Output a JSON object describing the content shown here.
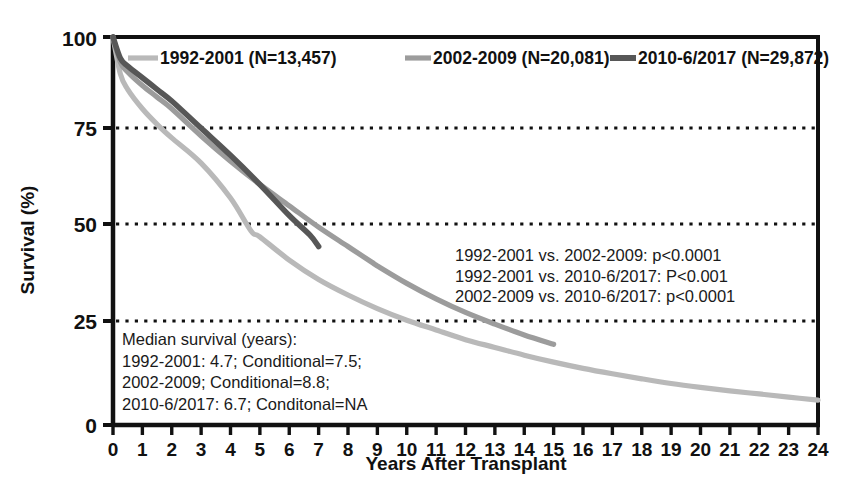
{
  "chart_data": {
    "type": "line",
    "title": "",
    "subtitle": "",
    "xlabel": "Years After Transplant",
    "ylabel": "Survival (%)",
    "xlim": [
      0,
      24
    ],
    "ylim": [
      0,
      100
    ],
    "xticks": [
      "0",
      "1",
      "2",
      "3",
      "4",
      "5",
      "6",
      "7",
      "8",
      "9",
      "10",
      "11",
      "12",
      "13",
      "14",
      "15",
      "16",
      "17",
      "18",
      "19",
      "20",
      "21",
      "22",
      "23",
      "24"
    ],
    "yticks": [
      "0",
      "25",
      "50",
      "75",
      "100"
    ],
    "gridlines_y": [
      25,
      50,
      75
    ],
    "grid": "horizontal-dotted",
    "legend_position": "top-inside",
    "series": [
      {
        "name": "1992-2001 (N=13,457)",
        "color": "#b9b9b9",
        "x": [
          0,
          0.25,
          0.5,
          1,
          1.5,
          2,
          3,
          4,
          4.7,
          5,
          6,
          7,
          8,
          9,
          10,
          11,
          12,
          13,
          14,
          15,
          16,
          17,
          18,
          19,
          20,
          21,
          22,
          23,
          24
        ],
        "y": [
          100,
          90.5,
          86.5,
          81.5,
          77.5,
          74,
          67.5,
          58.5,
          50,
          48.5,
          42.5,
          37.5,
          33.5,
          30,
          27,
          24.5,
          22,
          20,
          18,
          16.2,
          14.6,
          13.2,
          11.9,
          10.7,
          9.7,
          8.8,
          8.0,
          7.2,
          6.4
        ]
      },
      {
        "name": "2002-2009 (N=20,081)",
        "color": "#9c9c9c",
        "x": [
          0,
          0.25,
          0.5,
          1,
          1.5,
          2,
          3,
          4,
          5,
          6,
          7,
          8,
          8.8,
          9,
          10,
          11,
          12,
          13,
          14,
          15
        ],
        "y": [
          100,
          93.5,
          91,
          87.5,
          84.5,
          81.5,
          74.5,
          68,
          62,
          56.5,
          51,
          46,
          42,
          41,
          36.5,
          32.5,
          29,
          26,
          23.2,
          20.8
        ]
      },
      {
        "name": "2010-6/2017 (N=29,872)",
        "color": "#575757",
        "x": [
          0,
          0.25,
          0.5,
          1,
          1.5,
          2,
          3,
          4,
          5,
          6,
          6.7,
          7
        ],
        "y": [
          100,
          94.5,
          92.5,
          89.5,
          86.5,
          83.5,
          76.5,
          69.5,
          62,
          54,
          49,
          46
        ]
      }
    ],
    "annotations": [
      {
        "name": "pvalues",
        "lines": [
          "1992-2001 vs. 2002-2009: p<0.0001",
          "1992-2001 vs. 2010-6/2017: P<0.001",
          "2002-2009 vs. 2010-6/2017: p<0.0001"
        ]
      },
      {
        "name": "median-survival",
        "lines": [
          "Median survival (years):",
          "1992-2001: 4.7; Conditional=7.5;",
          "2002-2009; Conditional=8.8;",
          "2010-6/2017: 6.7; Conditonal=NA"
        ]
      }
    ]
  }
}
